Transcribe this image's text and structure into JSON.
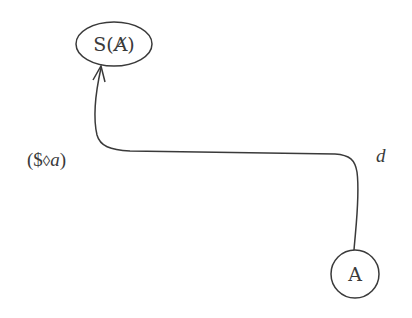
{
  "diagram": {
    "nodes": [
      {
        "id": "top-node",
        "label": "S(A̸)",
        "shape": "ellipse",
        "cx": 114,
        "cy": 44,
        "rx": 38,
        "ry": 22
      },
      {
        "id": "bottom-node",
        "label": "A",
        "shape": "circle",
        "cx": 355,
        "cy": 274,
        "r": 24
      }
    ],
    "edge": {
      "from": "bottom-node",
      "to": "top-node",
      "arrowhead": "open-arrow"
    },
    "labels": {
      "left": "($◊a)",
      "left_parts": {
        "open": "(",
        "sbarred": "$",
        "lozenge": "◊",
        "var": "a",
        "close": ")"
      },
      "right": "d"
    },
    "colors": {
      "ink": "#3a3a3a",
      "background": "#ffffff"
    }
  }
}
